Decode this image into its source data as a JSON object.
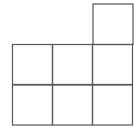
{
  "diagram": {
    "type": "grid-of-squares",
    "cell_size": 40,
    "stroke_color": "#555555",
    "background": "#ffffff",
    "cells": [
      {
        "row": 0,
        "col": 2,
        "x": 93,
        "y": 4
      },
      {
        "row": 1,
        "col": 0,
        "x": 12.5,
        "y": 44.5
      },
      {
        "row": 1,
        "col": 1,
        "x": 52.5,
        "y": 44.5
      },
      {
        "row": 1,
        "col": 2,
        "x": 92.5,
        "y": 44.5
      },
      {
        "row": 2,
        "col": 0,
        "x": 12.5,
        "y": 85
      },
      {
        "row": 2,
        "col": 1,
        "x": 52.5,
        "y": 85
      },
      {
        "row": 2,
        "col": 2,
        "x": 92.5,
        "y": 85
      }
    ]
  }
}
